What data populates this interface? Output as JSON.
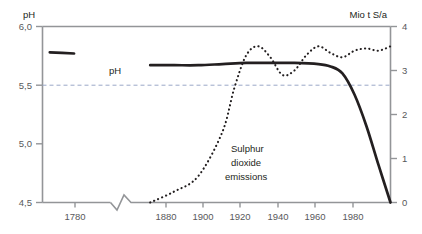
{
  "chart_data": {
    "type": "line",
    "title": "",
    "subtitle": "",
    "grid": "horizontal dashed gridline at pH 5,5 only",
    "legend_position": "inline annotations on curves",
    "xlabel": "",
    "x_axis": {
      "tick_labels": [
        "1780",
        "1880",
        "1900",
        "1920",
        "1940",
        "1960",
        "1980"
      ],
      "tick_values": [
        1780,
        1880,
        1900,
        1920,
        1940,
        1960,
        1980
      ],
      "axis_break": true,
      "axis_break_note": "zigzag break in x-axis between 1780 and 1880"
    },
    "left_axis": {
      "label": "pH",
      "tick_labels": [
        "6,0",
        "5,5",
        "5,0",
        "4,5"
      ],
      "tick_values": [
        6.0,
        5.5,
        5.0,
        4.5
      ],
      "ylim": [
        4.5,
        6.0
      ]
    },
    "right_axis": {
      "label": "Mio t S/a",
      "tick_labels": [
        "4",
        "3",
        "2",
        "1",
        "0"
      ],
      "tick_values": [
        4,
        3,
        2,
        1,
        0
      ],
      "ylim": [
        0,
        4
      ]
    },
    "series": [
      {
        "name": "pH",
        "label": "pH",
        "axis": "left",
        "style": "solid",
        "color": "#231f20",
        "x": [
          1765,
          1775,
          1790,
          1805,
          1820,
          1835,
          1850,
          1865,
          1880,
          1890,
          1900,
          1910,
          1920,
          1930,
          1940,
          1950,
          1955,
          1960,
          1965,
          1970,
          1975,
          1980
        ],
        "values": [
          5.78,
          5.77,
          5.75,
          5.73,
          5.71,
          5.7,
          5.69,
          5.68,
          5.67,
          5.67,
          5.67,
          5.68,
          5.69,
          5.69,
          5.69,
          5.68,
          5.66,
          5.6,
          5.42,
          5.15,
          4.82,
          4.5
        ]
      },
      {
        "name": "Sulphur dioxide emissions",
        "label_lines": [
          "Sulphur",
          "dioxide",
          "emissions"
        ],
        "axis": "right",
        "style": "dotted",
        "color": "#231f20",
        "x": [
          1880,
          1890,
          1900,
          1910,
          1915,
          1920,
          1925,
          1930,
          1935,
          1940,
          1945,
          1950,
          1955,
          1960,
          1965,
          1970,
          1975,
          1980
        ],
        "values": [
          0.0,
          0.25,
          0.6,
          1.6,
          2.6,
          3.35,
          3.55,
          3.3,
          2.9,
          3.0,
          3.35,
          3.55,
          3.4,
          3.3,
          3.45,
          3.5,
          3.45,
          3.55
        ]
      }
    ],
    "colors": {
      "curve": "#231f20",
      "axis": "#939598",
      "tick_text": "#58595b",
      "gridline": "#9aa7c7",
      "background": "#ffffff"
    }
  }
}
